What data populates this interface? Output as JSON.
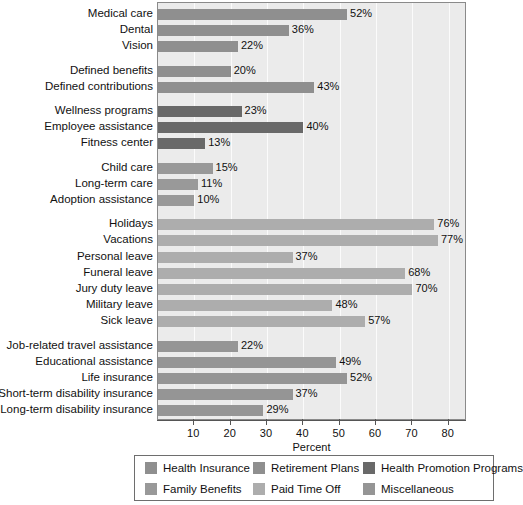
{
  "chart_data": {
    "type": "bar",
    "orientation": "horizontal",
    "title": "",
    "xlabel": "Percent",
    "ylabel": "",
    "xlim": [
      0,
      85
    ],
    "xticks": [
      10,
      20,
      30,
      40,
      50,
      60,
      70,
      80
    ],
    "grid": true,
    "legend_position": "bottom",
    "value_suffix": "%",
    "categories": [
      "Medical care",
      "Dental",
      "Vision",
      "Defined benefits",
      "Defined contributions",
      "Wellness programs",
      "Employee assistance",
      "Fitness center",
      "Child care",
      "Long-term care",
      "Adoption assistance",
      "Holidays",
      "Vacations",
      "Personal leave",
      "Funeral leave",
      "Jury duty leave",
      "Military leave",
      "Sick leave",
      "Job-related travel assistance",
      "Educational assistance",
      "Life insurance",
      "Short-term disability insurance",
      "Long-term disability insurance"
    ],
    "values": [
      52,
      36,
      22,
      20,
      43,
      23,
      40,
      13,
      15,
      11,
      10,
      76,
      77,
      37,
      68,
      70,
      48,
      57,
      22,
      49,
      52,
      37,
      29
    ],
    "groups": [
      {
        "name": "Health Insurance",
        "color": "#8f8f8f",
        "bars": [
          {
            "label": "Medical care",
            "value": 52
          },
          {
            "label": "Dental",
            "value": 36
          },
          {
            "label": "Vision",
            "value": 22
          }
        ]
      },
      {
        "name": "Retirement Plans",
        "color": "#8f8f8f",
        "bars": [
          {
            "label": "Defined benefits",
            "value": 20
          },
          {
            "label": "Defined contributions",
            "value": 43
          }
        ]
      },
      {
        "name": "Health Promotion Programs",
        "color": "#696969",
        "bars": [
          {
            "label": "Wellness programs",
            "value": 23
          },
          {
            "label": "Employee assistance",
            "value": 40
          },
          {
            "label": "Fitness center",
            "value": 13
          }
        ]
      },
      {
        "name": "Family Benefits",
        "color": "#999999",
        "bars": [
          {
            "label": "Child care",
            "value": 15
          },
          {
            "label": "Long-term care",
            "value": 11
          },
          {
            "label": "Adoption assistance",
            "value": 10
          }
        ]
      },
      {
        "name": "Paid Time Off",
        "color": "#adadad",
        "bars": [
          {
            "label": "Holidays",
            "value": 76
          },
          {
            "label": "Vacations",
            "value": 77
          },
          {
            "label": "Personal leave",
            "value": 37
          },
          {
            "label": "Funeral leave",
            "value": 68
          },
          {
            "label": "Jury duty leave",
            "value": 70
          },
          {
            "label": "Military leave",
            "value": 48
          },
          {
            "label": "Sick leave",
            "value": 57
          }
        ]
      },
      {
        "name": "Miscellaneous",
        "color": "#959595",
        "bars": [
          {
            "label": "Job-related travel assistance",
            "value": 22
          },
          {
            "label": "Educational assistance",
            "value": 49
          },
          {
            "label": "Life insurance",
            "value": 52
          },
          {
            "label": "Short-term disability insurance",
            "value": 37
          },
          {
            "label": "Long-term disability insurance",
            "value": 29
          }
        ]
      }
    ],
    "legend": [
      {
        "label": "Health Insurance",
        "color": "#8f8f8f"
      },
      {
        "label": "Retirement Plans",
        "color": "#8f8f8f"
      },
      {
        "label": "Health Promotion Programs",
        "color": "#696969"
      },
      {
        "label": "Family Benefits",
        "color": "#999999"
      },
      {
        "label": "Paid Time Off",
        "color": "#adadad"
      },
      {
        "label": "Miscellaneous",
        "color": "#959595"
      }
    ],
    "plot_background": "#ebebeb",
    "gridline_color": "#fbfbfb"
  }
}
